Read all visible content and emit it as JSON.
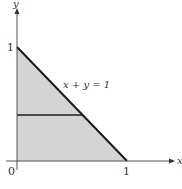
{
  "diagram": {
    "axes": {
      "x_label": "x",
      "y_label": "y",
      "origin_label": "0",
      "x_tick_label": "1",
      "y_tick_label": "1"
    },
    "equation_label": "x + y = 1",
    "colors": {
      "region_fill": "#d4d4d4",
      "boundary_line": "#1a1a1a",
      "axis": "#555555",
      "horizontal_line": "#4a4a4a"
    },
    "region": "triangle with vertices (0,0), (1,0), (0,1)",
    "horizontal_line_y": 0.4
  }
}
